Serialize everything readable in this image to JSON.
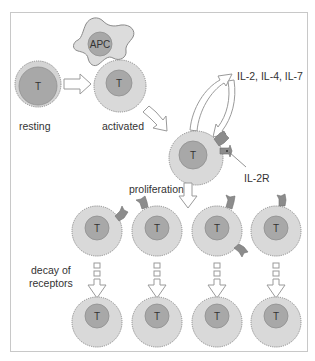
{
  "colors": {
    "background": "#ffffff",
    "frame": "#c8c8c8",
    "cell_fill": "#d9d9d9",
    "cell_edge": "#8a8a8a",
    "nucleus_fill": "#a8a8a8",
    "nucleus_edge": "#8f8f8f",
    "receptor_fill": "#8c8c8c",
    "arrow_fill": "#ffffff",
    "arrow_edge": "#9a9a9a",
    "text": "#333333"
  },
  "labels": {
    "resting": "resting",
    "activated": "activated",
    "cytokines": "IL-2, IL-4, IL-7",
    "receptor": "IL-2R",
    "proliferation": "proliferation",
    "decay_line1": "decay of",
    "decay_line2": "receptors",
    "apc": "APC",
    "t_cell": "T"
  },
  "nodes": {
    "resting_cell": {
      "nucleus": "T"
    },
    "apc_cell": {
      "nucleus": "APC"
    },
    "activated_cell": {
      "nucleus": "T"
    },
    "proliferating_cell": {
      "nucleus": "T"
    },
    "daughter_cells": [
      {
        "nucleus": "T"
      },
      {
        "nucleus": "T"
      },
      {
        "nucleus": "T"
      },
      {
        "nucleus": "T"
      }
    ],
    "decayed_cells": [
      {
        "nucleus": "T"
      },
      {
        "nucleus": "T"
      },
      {
        "nucleus": "T"
      },
      {
        "nucleus": "T"
      }
    ]
  }
}
